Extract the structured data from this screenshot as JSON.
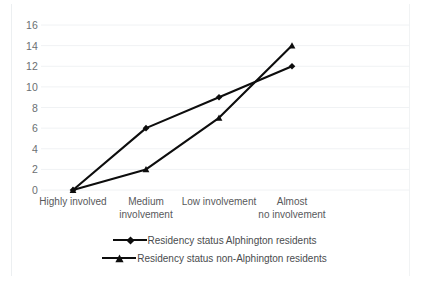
{
  "chart_data": {
    "type": "line",
    "title": "",
    "xlabel": "",
    "ylabel": "",
    "ylim": [
      0,
      16
    ],
    "ytick_step": 2,
    "grid": true,
    "grid_axis": "y",
    "legend_position": "bottom",
    "categories": [
      "Highly involved",
      "Medium involvement",
      "Low involvement",
      "Almost no involvement"
    ],
    "yticks": [
      "0",
      "2",
      "4",
      "6",
      "8",
      "10",
      "12",
      "14",
      "16"
    ],
    "series": [
      {
        "name": "Residency status Alphington residents",
        "marker": "diamond",
        "color": "#0d0d0d",
        "values": [
          0,
          6,
          9,
          12
        ]
      },
      {
        "name": "Residency status non-Alphington residents",
        "marker": "triangle",
        "color": "#0d0d0d",
        "values": [
          0,
          2,
          7,
          14
        ]
      }
    ]
  },
  "legend": {
    "items": [
      {
        "label": "Residency status Alphington residents",
        "marker": "diamond-marker-icon"
      },
      {
        "label": "Residency status non-Alphington residents",
        "marker": "triangle-marker-icon"
      }
    ]
  }
}
